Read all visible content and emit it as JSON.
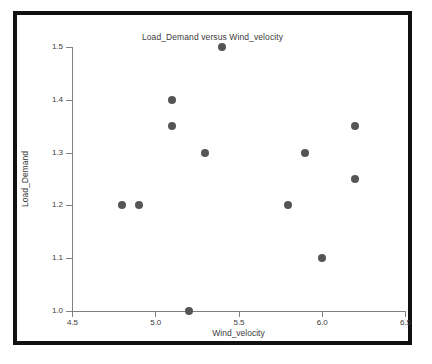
{
  "chart_data": {
    "type": "scatter",
    "title": "Load_Demand versus Wind_velocity",
    "xlabel": "Wind_velocity",
    "ylabel": "Load_Demand",
    "xlim": [
      4.5,
      6.5
    ],
    "ylim": [
      1.0,
      1.5
    ],
    "xticks": [
      "4.5",
      "5.0",
      "5.5",
      "6.0",
      "6.5"
    ],
    "xtick_values": [
      4.5,
      5.0,
      5.5,
      6.0,
      6.5
    ],
    "yticks": [
      "1.0",
      "1.1",
      "1.2",
      "1.3",
      "1.4",
      "1.5"
    ],
    "ytick_values": [
      1.0,
      1.1,
      1.2,
      1.3,
      1.4,
      1.5
    ],
    "grid": false,
    "legend": null,
    "marker_color": "#555555",
    "axis_color": "#808080",
    "text_color": "#3b3b3b",
    "series": [
      {
        "name": "Load_Demand",
        "x": [
          4.8,
          4.9,
          5.1,
          5.1,
          5.2,
          5.3,
          5.4,
          5.8,
          5.9,
          6.0,
          6.2,
          6.2
        ],
        "y": [
          1.2,
          1.2,
          1.4,
          1.35,
          1.0,
          1.3,
          1.5,
          1.2,
          1.3,
          1.1,
          1.35,
          1.25
        ]
      }
    ],
    "points": [
      {
        "x": 4.8,
        "y": 1.2
      },
      {
        "x": 4.9,
        "y": 1.2
      },
      {
        "x": 5.1,
        "y": 1.4
      },
      {
        "x": 5.1,
        "y": 1.35
      },
      {
        "x": 5.2,
        "y": 1.0
      },
      {
        "x": 5.3,
        "y": 1.3
      },
      {
        "x": 5.4,
        "y": 1.5
      },
      {
        "x": 5.8,
        "y": 1.2
      },
      {
        "x": 5.9,
        "y": 1.3
      },
      {
        "x": 6.0,
        "y": 1.1
      },
      {
        "x": 6.2,
        "y": 1.35
      },
      {
        "x": 6.2,
        "y": 1.25
      }
    ]
  }
}
